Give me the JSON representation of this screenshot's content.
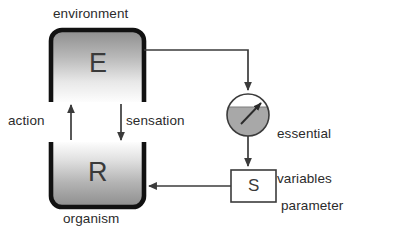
{
  "diagram": {
    "colors": {
      "ink": "#2b2b2b",
      "letter": "#3a3a3a",
      "box_outline": "#111111",
      "line": "#3b3b3b",
      "gauge_fill": "#a8a8a8",
      "gauge_outline": "#3b3b3b",
      "background": "#ffffff",
      "gradient_dark": "#8d8d8d",
      "gradient_light": "#fdfdfd"
    },
    "nodes": {
      "environment": {
        "letter": "E",
        "label": "environment",
        "shape": "rounded-top-open-bottom",
        "gradient": "dark-top-to-light-bottom"
      },
      "organism": {
        "letter": "R",
        "label": "organism",
        "shape": "rounded-bottom-open-top",
        "gradient": "light-top-to-dark-bottom"
      },
      "essential_variables": {
        "shape": "gauge-circle",
        "label_line1": "essential",
        "label_line2": "variables",
        "needle": "pointing-up-right",
        "fill_level": 0.66
      },
      "parameter_space": {
        "letter": "S",
        "shape": "rectangle",
        "label_line1": "parameter",
        "label_line2": "space (adaptation)"
      }
    },
    "edges": {
      "action": {
        "label": "action",
        "from": "organism",
        "to": "environment",
        "direction": "up"
      },
      "sensation": {
        "label": "sensation",
        "from": "environment",
        "to": "organism",
        "direction": "down"
      },
      "env_to_gauge": {
        "label": "",
        "from": "environment",
        "to": "essential_variables"
      },
      "gauge_to_s": {
        "label": "",
        "from": "essential_variables",
        "to": "parameter_space"
      },
      "s_to_organism": {
        "label": "",
        "from": "parameter_space",
        "to": "organism"
      }
    }
  }
}
